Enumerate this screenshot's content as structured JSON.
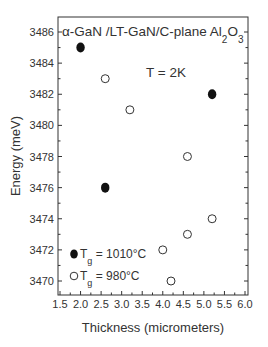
{
  "chart_data": {
    "type": "scatter",
    "title": "α-GaN /LT-GaN/C-plane Al2O3",
    "title_parts": {
      "main": "α-GaN /LT-GaN/C-plane Al",
      "sub1": "2",
      "mid": "O",
      "sub2": "3"
    },
    "annotation": "T = 2K",
    "xlabel": "Thickness (micrometers)",
    "ylabel": "Energy (meV)",
    "xlim": [
      1.5,
      6.0
    ],
    "ylim": [
      3469.2,
      3487.0
    ],
    "xticks": [
      1.5,
      2.0,
      2.5,
      3.0,
      3.5,
      4.0,
      4.5,
      5.0,
      5.5,
      6.0
    ],
    "xtick_labels": [
      "1.5",
      "2.0",
      "2.5",
      "3.0",
      "3.5",
      "4.0",
      "4.5",
      "5.0",
      "5.5",
      "6.0"
    ],
    "yticks": [
      3470,
      3472,
      3474,
      3476,
      3478,
      3480,
      3482,
      3484,
      3486
    ],
    "ytick_labels": [
      "3470",
      "3472",
      "3474",
      "3476",
      "3478",
      "3480",
      "3482",
      "3484",
      "3486"
    ],
    "grid": false,
    "legend_position": "lower left",
    "series": [
      {
        "name": "Tg = 1010°C",
        "legend_main": "T",
        "legend_sub": "g",
        "legend_rest": " = 1010°C",
        "marker": "filled-circle",
        "points": [
          [
            2.0,
            3485
          ],
          [
            2.6,
            3476
          ],
          [
            5.2,
            3482
          ]
        ]
      },
      {
        "name": "Tg = 980°C",
        "legend_main": "T",
        "legend_sub": "g",
        "legend_rest": " = 980°C",
        "marker": "open-circle",
        "points": [
          [
            2.6,
            3483
          ],
          [
            3.2,
            3481
          ],
          [
            4.6,
            3478
          ],
          [
            5.2,
            3474
          ],
          [
            4.6,
            3473
          ],
          [
            4.0,
            3472
          ],
          [
            4.2,
            3470
          ]
        ]
      }
    ]
  }
}
